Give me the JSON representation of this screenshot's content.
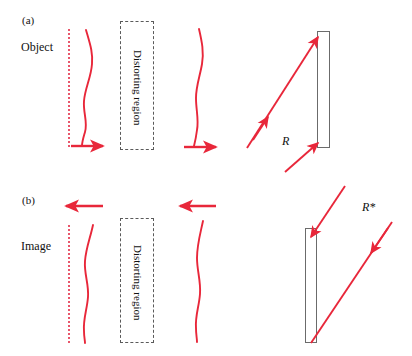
{
  "figure": {
    "accent_color": "#e8273a",
    "dotted_color": "#e8566b",
    "outline_color": "#6b6b6b",
    "dashed_color": "#5a5a5a",
    "text_color": "#111111",
    "width": 412,
    "height": 356
  },
  "panels": [
    {
      "id": "panel-a",
      "label": "(a)",
      "side_label": "Object",
      "region_label": "Distorting region",
      "ray_label": "R",
      "direction": "rightward",
      "description": "Object wavefront travels to the right through the distorting region and onto the mirror"
    },
    {
      "id": "panel-b",
      "label": "(b)",
      "side_label": "Image",
      "region_label": "Distorting region",
      "ray_label": "R*",
      "direction": "leftward",
      "description": "Conjugated wavefront returns to the left through the distorting region forming the image"
    }
  ],
  "elements": {
    "reference_line_label": "reference-dotted-line",
    "wavefront_label": "wavefront-curve",
    "propagation_arrow_label": "propagation-arrow",
    "mirror_label": "mirror",
    "ray_label": "ray"
  }
}
